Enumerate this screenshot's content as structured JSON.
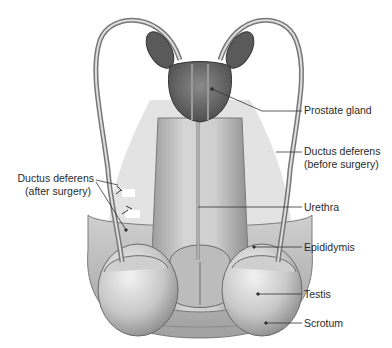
{
  "diagram": {
    "labels": {
      "prostate_gland": "Prostate gland",
      "ductus_before_line1": "Ductus deferens",
      "ductus_before_line2": "(before surgery)",
      "ductus_after_line1": "Ductus deferens",
      "ductus_after_line2": "(after surgery)",
      "urethra": "Urethra",
      "epididymis": "Epididymis",
      "testis": "Testis",
      "scrotum": "Scrotum"
    },
    "colors": {
      "background": "#ffffff",
      "tissue_light": "#d9d9d9",
      "tissue_mid": "#b5b5b5",
      "tissue_dark": "#6e6e6e",
      "leader_line": "#333333",
      "label_text": "#2a2a2a"
    }
  }
}
